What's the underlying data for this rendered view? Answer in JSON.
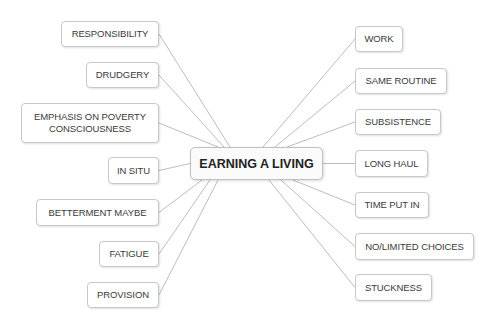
{
  "central": {
    "label": "EARNING A LIVING",
    "x": 190,
    "y": 147,
    "w": 133,
    "h": 33
  },
  "colors": {
    "line": "#b5b5b5",
    "border": "#c8c8c8",
    "text": "#3a3a3a"
  },
  "left_nodes": [
    {
      "label": "RESPONSIBILITY",
      "x": 61,
      "y": 21,
      "w": 98,
      "h": 26
    },
    {
      "label": "DRUDGERY",
      "x": 86,
      "y": 62,
      "w": 73,
      "h": 26
    },
    {
      "label": "EMPHASIS ON POVERTY\nCONSCIOUSNESS",
      "x": 21,
      "y": 103,
      "w": 138,
      "h": 40
    },
    {
      "label": "IN SITU",
      "x": 108,
      "y": 157,
      "w": 51,
      "h": 27
    },
    {
      "label": "BETTERMENT MAYBE",
      "x": 36,
      "y": 199,
      "w": 123,
      "h": 27
    },
    {
      "label": "FATIGUE",
      "x": 99,
      "y": 241,
      "w": 60,
      "h": 26
    },
    {
      "label": "PROVISION",
      "x": 87,
      "y": 282,
      "w": 72,
      "h": 26
    }
  ],
  "right_nodes": [
    {
      "label": "WORK",
      "x": 355,
      "y": 26,
      "w": 48,
      "h": 26
    },
    {
      "label": "SAME ROUTINE",
      "x": 355,
      "y": 68,
      "w": 92,
      "h": 26
    },
    {
      "label": "SUBSISTENCE",
      "x": 355,
      "y": 109,
      "w": 86,
      "h": 26
    },
    {
      "label": "LONG HAUL",
      "x": 355,
      "y": 150,
      "w": 73,
      "h": 27
    },
    {
      "label": "TIME PUT IN",
      "x": 355,
      "y": 192,
      "w": 74,
      "h": 26
    },
    {
      "label": "NO/LIMITED CHOICES",
      "x": 355,
      "y": 233,
      "w": 119,
      "h": 27
    },
    {
      "label": "STUCKNESS",
      "x": 355,
      "y": 274,
      "w": 77,
      "h": 27
    }
  ]
}
